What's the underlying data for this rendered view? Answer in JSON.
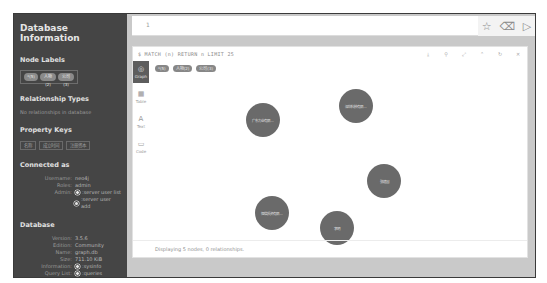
{
  "sidebar": {
    "title": "Database Information",
    "node_labels": {
      "heading": "Node Labels",
      "items": [
        "*(5)",
        "人物(2)",
        "公司(3)"
      ]
    },
    "relationship_types": {
      "heading": "Relationship Types",
      "empty_text": "No relationships in database"
    },
    "property_keys": {
      "heading": "Property Keys",
      "items": [
        "名称",
        "成立时间",
        "注册资本"
      ]
    },
    "connected_as": {
      "heading": "Connected as",
      "username_label": "Username:",
      "username": "neo4j",
      "roles_label": "Roles:",
      "roles": "admin",
      "admin_label": "Admin:",
      "admin_links": [
        ":server user list",
        ":server user add"
      ]
    },
    "database": {
      "heading": "Database",
      "version_label": "Version:",
      "version": "3.5.6",
      "edition_label": "Edition:",
      "edition": "Community",
      "name_label": "Name:",
      "name": "graph.db",
      "size_label": "Size:",
      "size": "711.10 KiB",
      "information_label": "Information:",
      "information_link": ":sysinfo",
      "query_list_label": "Query List:",
      "query_list_link": ":queries"
    }
  },
  "editor": {
    "line_number": "1",
    "actions": {
      "favorite_icon": "☆",
      "clear_icon": "⌫",
      "run_icon": "▷"
    }
  },
  "result_frame": {
    "query": "$ MATCH (n) RETURN n LIMIT 25",
    "actions": [
      "⤓",
      "⚲",
      "⤢",
      "⌃",
      "↻",
      "✕"
    ],
    "view_tabs": [
      {
        "icon": "◎",
        "label": "Graph",
        "active": true
      },
      {
        "icon": "▦",
        "label": "Table",
        "active": false
      },
      {
        "icon": "A",
        "label": "Text",
        "active": false
      },
      {
        "icon": "▭",
        "label": "Code",
        "active": false
      }
    ],
    "legend": [
      "*(5)",
      "人物(2)",
      "公司(3)"
    ],
    "nodes": [
      {
        "label": "广东力业有限…",
        "x": 114,
        "y": 45,
        "r": 17
      },
      {
        "label": "深圳科技有限…",
        "x": 207,
        "y": 31,
        "r": 17
      },
      {
        "label": "张建国",
        "x": 235,
        "y": 106,
        "r": 17
      },
      {
        "label": "恒信投资有限…",
        "x": 123,
        "y": 138,
        "r": 17
      },
      {
        "label": "李明",
        "x": 188,
        "y": 153,
        "r": 17
      }
    ],
    "status": "Displaying 5 nodes, 0 relationships."
  }
}
